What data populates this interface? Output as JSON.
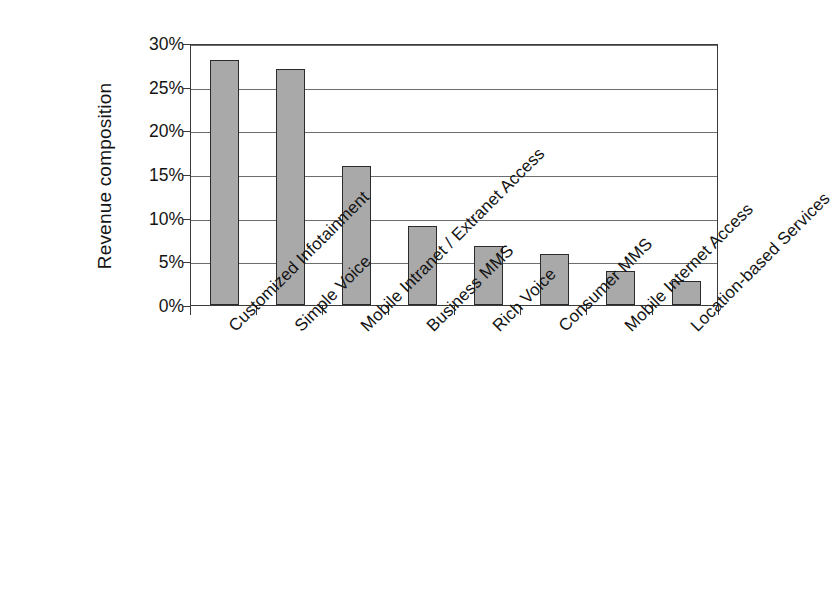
{
  "chart_data": {
    "type": "bar",
    "title": "",
    "subtitle": "",
    "xlabel": "",
    "ylabel": "Revenue composition",
    "ylim": [
      0,
      30
    ],
    "yticks": [
      0,
      5,
      10,
      15,
      20,
      25,
      30
    ],
    "ytick_labels": [
      "0%",
      "5%",
      "10%",
      "15%",
      "20%",
      "25%",
      "30%"
    ],
    "grid": true,
    "legend": false,
    "legend_position": "none",
    "orientation": "vertical",
    "bar_fill_color": "#a9a9a9",
    "bar_edge_color": "#2b2b2b",
    "axis_color": "#3a3a3a",
    "gridline_color": "#6d6d6d",
    "background_color": "#ffffff",
    "value_unit": "percent",
    "categories": [
      "Customized Infotainment",
      "Simple Voice",
      "Mobile Intranet / Extranet Access",
      "Business MMS",
      "Rich Voice",
      "Consumer MMS",
      "Mobile Internet Access",
      "Location-based Services"
    ],
    "values": [
      28.0,
      27.0,
      15.9,
      9.0,
      6.8,
      5.8,
      3.9,
      2.7
    ],
    "value_labels": [
      "28%",
      "27%",
      "15.9%",
      "9%",
      "6.8%",
      "5.8%",
      "3.9%",
      "2.7%"
    ]
  }
}
